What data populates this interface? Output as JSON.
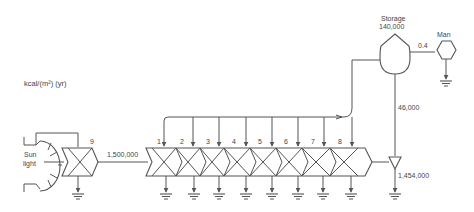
{
  "diagram": {
    "units_label": "kcal/(m²) (yr)",
    "source": {
      "label_line1": "Sun",
      "label_line2": "light"
    },
    "first_consumer": {
      "number": "9"
    },
    "input_flow": "1,500,000",
    "chain_numbers": [
      "1",
      "2",
      "3",
      "4",
      "5",
      "6",
      "7",
      "8"
    ],
    "storage": {
      "label": "Storage",
      "value": "140,000"
    },
    "man": {
      "label": "Man",
      "flow_from_storage": "0.4"
    },
    "storage_down_flow": "46,000",
    "heat_sink_flow": "1,454,000",
    "line_color": "#555555",
    "text_color": "#444444"
  }
}
